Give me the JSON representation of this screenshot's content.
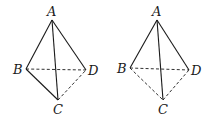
{
  "figures": [
    {
      "name": "tetrahedron-left",
      "vertices": {
        "A": {
          "x": 52,
          "y": 20,
          "label": "A",
          "lx": 47,
          "ly": 16
        },
        "B": {
          "x": 26,
          "y": 69,
          "label": "B",
          "lx": 13,
          "ly": 74
        },
        "D": {
          "x": 86,
          "y": 70,
          "label": "D",
          "lx": 88,
          "ly": 75
        },
        "C": {
          "x": 58,
          "y": 100,
          "label": "C",
          "lx": 53,
          "ly": 114
        }
      },
      "solid_edges": [
        [
          "A",
          "B"
        ],
        [
          "A",
          "D"
        ],
        [
          "A",
          "C"
        ],
        [
          "B",
          "C"
        ]
      ],
      "dashed_edges": [
        [
          "B",
          "D"
        ],
        [
          "C",
          "D"
        ]
      ]
    },
    {
      "name": "tetrahedron-right",
      "vertices": {
        "A": {
          "x": 157,
          "y": 20,
          "label": "A",
          "lx": 152,
          "ly": 16
        },
        "B": {
          "x": 130,
          "y": 68,
          "label": "B",
          "lx": 117,
          "ly": 73
        },
        "D": {
          "x": 189,
          "y": 70,
          "label": "D",
          "lx": 191,
          "ly": 75
        },
        "C": {
          "x": 163,
          "y": 100,
          "label": "C",
          "lx": 158,
          "ly": 114
        }
      },
      "solid_edges": [
        [
          "A",
          "B"
        ],
        [
          "A",
          "D"
        ],
        [
          "A",
          "C"
        ]
      ],
      "dashed_edges": [
        [
          "B",
          "D"
        ],
        [
          "B",
          "C"
        ],
        [
          "C",
          "D"
        ]
      ]
    }
  ],
  "colors": {
    "stroke": "#1a1a1a",
    "background": "#ffffff"
  }
}
